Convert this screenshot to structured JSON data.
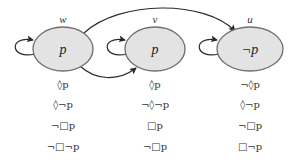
{
  "diagram": {
    "type": "kripke-model",
    "colors": {
      "node_fill": "#e3e3e3",
      "node_stroke": "#6f6f6f",
      "edge": "#2a2a2a",
      "text": "#333333"
    },
    "worlds": [
      {
        "id": "w",
        "label": "w",
        "value": "p",
        "reflexive": true,
        "formulas": [
          "◊p",
          "◊¬p",
          "¬□p",
          "¬□¬p"
        ]
      },
      {
        "id": "v",
        "label": "v",
        "value": "p",
        "reflexive": true,
        "formulas": [
          "◊p",
          "¬◊¬p",
          "□p",
          "¬□p"
        ]
      },
      {
        "id": "u",
        "label": "u",
        "value": "¬p",
        "reflexive": true,
        "formulas": [
          "¬◊p",
          "◊¬p",
          "¬□p",
          "□¬p"
        ]
      }
    ],
    "edges": [
      {
        "from": "w",
        "to": "w"
      },
      {
        "from": "v",
        "to": "v"
      },
      {
        "from": "u",
        "to": "u"
      },
      {
        "from": "w",
        "to": "u"
      },
      {
        "from": "w",
        "to": "v"
      }
    ]
  }
}
